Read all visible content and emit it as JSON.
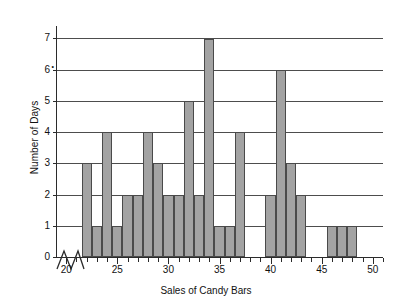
{
  "chart_data": {
    "type": "bar",
    "title": "",
    "subtitle": "",
    "xlabel": "Sales of Candy Bars",
    "ylabel": "Number of Days",
    "xlim": [
      19,
      51
    ],
    "ylim": [
      0,
      7.4
    ],
    "grid": "horizontal",
    "legend": "none",
    "axis_break": "x-axis broken between 0 and 20",
    "x_tick_labels": [
      "20",
      "25",
      "30",
      "35",
      "40",
      "45",
      "50"
    ],
    "x_tick_values": [
      20,
      25,
      30,
      35,
      40,
      45,
      50
    ],
    "x_minor_tick_step": 1,
    "y_tick_labels": [
      "0",
      "1",
      "2",
      "3",
      "4",
      "5",
      "6",
      "7"
    ],
    "y_tick_values": [
      0,
      1,
      2,
      3,
      4,
      5,
      6,
      7
    ],
    "bar_fill": "#a3a3a3",
    "bar_stroke": "#4a4a4a",
    "categories": [
      20,
      21,
      22,
      23,
      24,
      25,
      26,
      27,
      28,
      29,
      30,
      31,
      32,
      33,
      34,
      35,
      36,
      37,
      38,
      39,
      40,
      41,
      42,
      43,
      44,
      45,
      46,
      47,
      48,
      49,
      50
    ],
    "values": [
      0,
      0,
      3,
      1,
      4,
      1,
      2,
      2,
      4,
      3,
      2,
      2,
      5,
      2,
      7,
      1,
      1,
      4,
      0,
      0,
      2,
      6,
      3,
      2,
      0,
      0,
      1,
      1,
      1,
      0,
      0
    ]
  }
}
